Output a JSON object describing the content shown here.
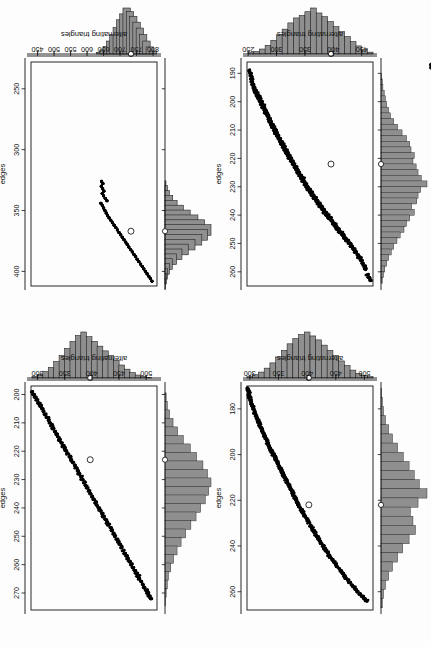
{
  "figure": {
    "rotation_note": "scan rotated 90 degrees",
    "panel_count": 4,
    "background_color": "#fdfdfd",
    "point_color": "#000000",
    "histogram_fill": "#8f8f8f",
    "histogram_outline": "#1a1a1a",
    "observed_marker_style": "open circle"
  },
  "chart_data": [
    {
      "panel": "top-left",
      "type": "scatter",
      "title": "",
      "xlabel": "edges",
      "ylabel": "alternating triangles",
      "xlim": [
        186,
        265
      ],
      "ylim": [
        248,
        470
      ],
      "xticks": [
        190,
        200,
        210,
        220,
        230,
        240,
        250,
        260
      ],
      "yticks": [
        250,
        300,
        350,
        400,
        450
      ],
      "grid": false,
      "observed_point": {
        "x": 222,
        "y": 396
      },
      "points_note": "≈550 simulated points along a tight negative linear band",
      "x": [
        263,
        262,
        261,
        259,
        258,
        257,
        256,
        255,
        255,
        254,
        253,
        253,
        252,
        252,
        251,
        251,
        250,
        250,
        249,
        249,
        248,
        248,
        247,
        247,
        246,
        246,
        246,
        245,
        245,
        244,
        244,
        243,
        243,
        243,
        242,
        242,
        241,
        241,
        241,
        240,
        240,
        240,
        239,
        239,
        239,
        238,
        238,
        238,
        237,
        237,
        237,
        236,
        236,
        236,
        235,
        235,
        235,
        234,
        234,
        234,
        233,
        233,
        233,
        232,
        232,
        232,
        231,
        231,
        231,
        230,
        230,
        230,
        229,
        229,
        229,
        228,
        228,
        228,
        227,
        227,
        227,
        226,
        226,
        226,
        225,
        225,
        225,
        224,
        224,
        224,
        223,
        223,
        223,
        222,
        222,
        222,
        221,
        221,
        221,
        220,
        220,
        220,
        219,
        219,
        219,
        218,
        218,
        218,
        217,
        217,
        217,
        216,
        216,
        216,
        215,
        215,
        215,
        214,
        214,
        214,
        213,
        213,
        213,
        212,
        212,
        212,
        211,
        211,
        211,
        210,
        210,
        210,
        209,
        209,
        209,
        208,
        208,
        208,
        207,
        207,
        207,
        206,
        206,
        206,
        205,
        205,
        205,
        204,
        204,
        204,
        203,
        203,
        203,
        202,
        202,
        202,
        201,
        201,
        201,
        200,
        200,
        200,
        199,
        199,
        199,
        198,
        198,
        198,
        197,
        197,
        196,
        196,
        195,
        195,
        194,
        194,
        193,
        192,
        191,
        190,
        189,
        188,
        187
      ],
      "y": [
        466,
        463,
        460,
        457,
        455,
        452,
        450,
        448,
        445,
        443,
        441,
        439,
        437,
        435,
        433,
        431,
        429,
        427,
        425,
        423,
        421,
        419,
        418,
        416,
        414,
        412,
        411,
        409,
        407,
        406,
        404,
        403,
        401,
        400,
        398,
        397,
        395,
        394,
        392,
        391,
        390,
        388,
        387,
        386,
        384,
        383,
        382,
        381,
        379,
        378,
        377,
        376,
        374,
        373,
        372,
        371,
        370,
        368,
        367,
        366,
        365,
        364,
        363,
        362,
        361,
        359,
        358,
        357,
        356,
        355,
        354,
        353,
        352,
        351,
        350,
        349,
        348,
        347,
        346,
        345,
        344,
        343,
        342,
        341,
        340,
        339,
        338,
        337,
        336,
        335,
        334,
        333,
        332,
        331,
        330,
        329,
        328,
        327,
        326,
        325,
        324,
        323,
        322,
        321,
        320,
        319,
        318,
        317,
        316,
        315,
        314,
        313,
        313,
        312,
        311,
        310,
        309,
        308,
        307,
        306,
        305,
        305,
        304,
        303,
        302,
        301,
        300,
        299,
        298,
        298,
        297,
        296,
        295,
        294,
        293,
        293,
        292,
        291,
        290,
        289,
        288,
        288,
        287,
        286,
        285,
        284,
        284,
        283,
        282,
        281,
        280,
        280,
        279,
        278,
        277,
        276,
        276,
        275,
        274,
        273,
        272,
        272,
        271,
        270,
        269,
        268,
        267,
        266,
        265,
        264,
        263,
        262,
        261,
        260,
        259,
        258,
        257,
        256,
        255,
        254,
        252
      ]
    },
    {
      "panel": "top-right",
      "type": "scatter",
      "title": "",
      "xlabel": "edges",
      "ylabel": "alternating triangles",
      "xlim": [
        170,
        268
      ],
      "ylim": [
        295,
        515
      ],
      "xticks": [
        180,
        200,
        220,
        240,
        260
      ],
      "yticks": [
        300,
        350,
        400,
        450,
        500
      ],
      "grid": false,
      "observed_point": {
        "x": 222,
        "y": 403
      },
      "points_note": "≈600 simulated points along a very tight negative linear band",
      "x": [
        264,
        263,
        262,
        261,
        260,
        259,
        258,
        257,
        256,
        255,
        254,
        253,
        252,
        251,
        250,
        249,
        248,
        247,
        246,
        245,
        244,
        243,
        242,
        241,
        240,
        239,
        238,
        237,
        236,
        235,
        234,
        233,
        232,
        231,
        230,
        229,
        228,
        227,
        226,
        225,
        224,
        223,
        222,
        221,
        220,
        219,
        218,
        217,
        216,
        215,
        214,
        213,
        212,
        211,
        210,
        209,
        208,
        207,
        206,
        205,
        204,
        203,
        202,
        201,
        200,
        199,
        198,
        197,
        196,
        195,
        194,
        193,
        192,
        191,
        190,
        189,
        188,
        187,
        186,
        185,
        184,
        183,
        182,
        181,
        180,
        179,
        178,
        177,
        176,
        175,
        174,
        173,
        172,
        171
      ],
      "y": [
        504,
        500,
        496,
        492,
        488,
        485,
        481,
        478,
        474,
        471,
        468,
        465,
        462,
        459,
        456,
        453,
        450,
        447,
        444,
        441,
        438,
        436,
        433,
        430,
        428,
        425,
        423,
        420,
        418,
        415,
        413,
        410,
        408,
        406,
        403,
        401,
        399,
        396,
        394,
        392,
        390,
        387,
        385,
        383,
        381,
        379,
        377,
        375,
        373,
        371,
        369,
        367,
        365,
        363,
        361,
        359,
        357,
        355,
        353,
        351,
        349,
        347,
        345,
        343,
        341,
        339,
        337,
        335,
        333,
        331,
        330,
        328,
        326,
        324,
        322,
        321,
        319,
        317,
        316,
        314,
        312,
        311,
        309,
        308,
        306,
        305,
        303,
        302,
        301,
        300,
        299,
        298,
        297,
        296
      ]
    },
    {
      "panel": "bottom-left",
      "type": "scatter",
      "title": "",
      "xlabel": "edges",
      "ylabel": "alternating triangles",
      "xlim": [
        228,
        412
      ],
      "ylim": [
        430,
        812
      ],
      "xticks": [
        250,
        300,
        350,
        400
      ],
      "yticks": [
        450,
        500,
        550,
        600,
        650,
        700,
        750,
        800
      ],
      "grid": false,
      "observed_point": {
        "x": 367,
        "y": 733
      },
      "points_note": "extremely tight, nearly deterministic negative linear relation; narrow range of edges (325-408)",
      "x": [
        408,
        406,
        404,
        402,
        400,
        398,
        396,
        394,
        392,
        390,
        388,
        386,
        384,
        382,
        380,
        378,
        376,
        374,
        372,
        370,
        368,
        366,
        364,
        362,
        360,
        358,
        356,
        354,
        352,
        350,
        348,
        346,
        344,
        342,
        340,
        338,
        336,
        334,
        332,
        330,
        328,
        326
      ],
      "y": [
        797,
        792,
        787,
        782,
        777,
        772,
        767,
        762,
        757,
        752,
        747,
        742,
        737,
        732,
        727,
        722,
        717,
        712,
        707,
        702,
        697,
        692,
        687,
        682,
        677,
        672,
        667,
        662,
        658,
        654,
        650,
        646,
        642,
        660,
        655,
        650,
        646,
        651,
        647,
        643,
        648,
        644
      ]
    },
    {
      "panel": "bottom-right",
      "type": "scatter",
      "title": "",
      "xlabel": "edges",
      "ylabel": "alternating triangles",
      "xlim": [
        197,
        276
      ],
      "ylim": [
        288,
        520
      ],
      "xticks": [
        200,
        210,
        220,
        230,
        240,
        250,
        260,
        270
      ],
      "yticks": [
        300,
        350,
        400,
        450,
        500
      ],
      "grid": false,
      "observed_point": {
        "x": 223,
        "y": 397
      },
      "points_note": "≈600 simulated points along a negative linear band with visible scatter",
      "x": [
        272,
        271,
        270,
        269,
        268,
        267,
        266,
        265,
        264,
        263,
        262,
        261,
        260,
        259,
        258,
        257,
        256,
        255,
        254,
        253,
        252,
        251,
        250,
        249,
        248,
        247,
        246,
        245,
        244,
        243,
        242,
        241,
        240,
        239,
        238,
        237,
        236,
        235,
        234,
        233,
        232,
        231,
        230,
        229,
        228,
        227,
        226,
        225,
        224,
        223,
        222,
        221,
        220,
        219,
        218,
        217,
        216,
        215,
        214,
        213,
        212,
        211,
        210,
        209,
        208,
        207,
        206,
        205,
        204,
        203,
        202,
        201,
        200,
        199
      ],
      "y": [
        509,
        506,
        503,
        500,
        497,
        494,
        491,
        488,
        485,
        482,
        479,
        476,
        473,
        470,
        467,
        464,
        461,
        458,
        455,
        452,
        449,
        446,
        443,
        440,
        437,
        434,
        431,
        428,
        425,
        422,
        419,
        416,
        413,
        410,
        407,
        404,
        401,
        398,
        395,
        392,
        389,
        386,
        383,
        380,
        377,
        374,
        371,
        368,
        365,
        362,
        359,
        356,
        353,
        350,
        347,
        344,
        341,
        338,
        335,
        332,
        329,
        326,
        323,
        320,
        317,
        314,
        311,
        308,
        305,
        302,
        299,
        296,
        293,
        290
      ]
    }
  ],
  "marginal_histograms": [
    {
      "panel": "top-left",
      "axis": "x",
      "variable": "edges",
      "observed_value": 222,
      "bin_centers": [
        191,
        193,
        195,
        197,
        199,
        201,
        203,
        205,
        207,
        209,
        211,
        213,
        215,
        217,
        219,
        221,
        223,
        225,
        227,
        229,
        231,
        233,
        235,
        237,
        239,
        241,
        243,
        245,
        247,
        249,
        251,
        253,
        255,
        257,
        259,
        261,
        263
      ],
      "counts": [
        1,
        2,
        3,
        5,
        7,
        9,
        12,
        15,
        20,
        26,
        33,
        40,
        45,
        47,
        52,
        50,
        55,
        58,
        63,
        72,
        62,
        58,
        56,
        48,
        52,
        45,
        40,
        36,
        30,
        25,
        20,
        16,
        12,
        9,
        6,
        4,
        2
      ]
    },
    {
      "panel": "top-left",
      "axis": "y",
      "variable": "alternating triangles",
      "observed_value": 396,
      "bin_centers": [
        255,
        265,
        275,
        285,
        295,
        305,
        315,
        325,
        335,
        345,
        355,
        365,
        375,
        385,
        395,
        405,
        415,
        425,
        435,
        445,
        455,
        465
      ],
      "counts": [
        2,
        4,
        8,
        14,
        22,
        31,
        40,
        50,
        58,
        62,
        68,
        74,
        66,
        60,
        52,
        44,
        36,
        28,
        20,
        13,
        7,
        3
      ]
    },
    {
      "panel": "top-right",
      "axis": "x",
      "variable": "edges",
      "observed_value": 222,
      "bin_centers": [
        173,
        177,
        181,
        185,
        189,
        193,
        197,
        201,
        205,
        209,
        213,
        217,
        221,
        225,
        229,
        233,
        237,
        241,
        245,
        249,
        253,
        257,
        261,
        265
      ],
      "counts": [
        1,
        2,
        4,
        7,
        12,
        18,
        26,
        35,
        44,
        52,
        60,
        72,
        58,
        46,
        50,
        54,
        44,
        34,
        26,
        18,
        12,
        7,
        4,
        2
      ]
    },
    {
      "panel": "top-right",
      "axis": "y",
      "variable": "alternating triangles",
      "observed_value": 403,
      "bin_centers": [
        300,
        310,
        320,
        330,
        340,
        350,
        360,
        370,
        380,
        390,
        400,
        410,
        420,
        430,
        440,
        450,
        460,
        470,
        480,
        490,
        500,
        510
      ],
      "counts": [
        2,
        5,
        9,
        15,
        23,
        32,
        42,
        52,
        60,
        66,
        70,
        64,
        58,
        50,
        42,
        34,
        26,
        19,
        12,
        7,
        4,
        2
      ]
    },
    {
      "panel": "bottom-left",
      "axis": "x",
      "variable": "edges",
      "observed_value": 367,
      "bin_centers": [
        330,
        334,
        338,
        342,
        346,
        350,
        354,
        358,
        362,
        366,
        370,
        374,
        378,
        382,
        386,
        390,
        394,
        398,
        402,
        406,
        410
      ],
      "counts": [
        2,
        5,
        9,
        16,
        25,
        38,
        52,
        68,
        82,
        95,
        88,
        76,
        62,
        48,
        35,
        24,
        15,
        9,
        5,
        3,
        1
      ]
    },
    {
      "panel": "bottom-left",
      "axis": "y",
      "variable": "alternating triangles",
      "observed_value": 733,
      "bin_centers": [
        640,
        650,
        660,
        670,
        680,
        690,
        700,
        710,
        720,
        730,
        740,
        750,
        760,
        770,
        780,
        790,
        800
      ],
      "counts": [
        3,
        7,
        13,
        22,
        33,
        45,
        58,
        68,
        78,
        72,
        64,
        54,
        44,
        33,
        22,
        12,
        5
      ]
    },
    {
      "panel": "bottom-right",
      "axis": "x",
      "variable": "edges",
      "observed_value": 223,
      "bin_centers": [
        201,
        204,
        207,
        210,
        213,
        216,
        219,
        222,
        225,
        228,
        231,
        234,
        237,
        240,
        243,
        246,
        249,
        252,
        255,
        258,
        261,
        264,
        267,
        270,
        273
      ],
      "counts": [
        2,
        4,
        8,
        14,
        22,
        32,
        44,
        55,
        66,
        74,
        80,
        76,
        70,
        62,
        54,
        45,
        36,
        28,
        21,
        15,
        10,
        6,
        4,
        2,
        1
      ]
    },
    {
      "panel": "bottom-right",
      "axis": "y",
      "variable": "alternating triangles",
      "observed_value": 397,
      "bin_centers": [
        295,
        305,
        315,
        325,
        335,
        345,
        355,
        365,
        375,
        385,
        395,
        405,
        415,
        425,
        435,
        445,
        455,
        465,
        475,
        485,
        495,
        505
      ],
      "counts": [
        3,
        6,
        11,
        18,
        28,
        38,
        50,
        62,
        72,
        78,
        70,
        62,
        54,
        46,
        38,
        30,
        22,
        15,
        9,
        5,
        3,
        1
      ]
    }
  ],
  "labels": {
    "xlabel": "edges",
    "ylabel": "alternating triangles"
  }
}
